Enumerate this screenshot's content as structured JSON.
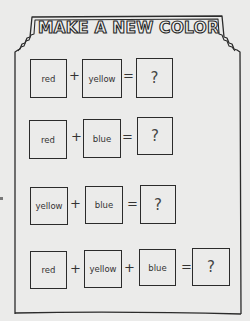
{
  "worksheet": {
    "title": "MAKE A NEW COLOR",
    "rows": [
      {
        "terms": [
          "red",
          "yellow"
        ],
        "operators": [
          "+",
          "="
        ],
        "answer": "?"
      },
      {
        "terms": [
          "red",
          "blue"
        ],
        "operators": [
          "+",
          "="
        ],
        "answer": "?"
      },
      {
        "terms": [
          "yellow",
          "blue"
        ],
        "operators": [
          "+",
          "="
        ],
        "answer": "?"
      },
      {
        "terms": [
          "red",
          "yellow",
          "blue"
        ],
        "operators": [
          "+",
          "+",
          "="
        ],
        "answer": "?"
      }
    ]
  },
  "colors": {
    "background": "#ebebea",
    "ink": "#2b2b2b"
  }
}
